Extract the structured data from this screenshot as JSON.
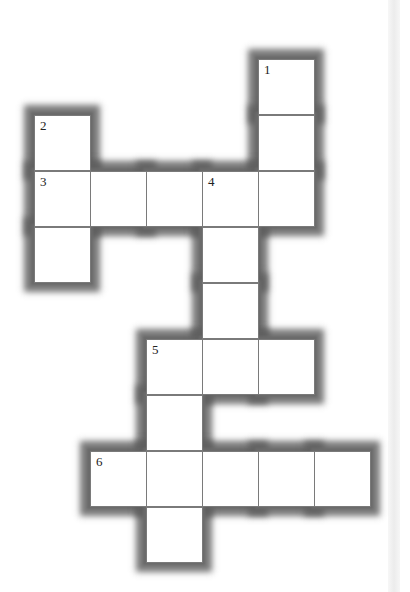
{
  "puzzle": {
    "type": "crossword",
    "cell_size_px": 56,
    "origin": {
      "x": 34,
      "y": 59
    },
    "cells": [
      {
        "row": 0,
        "col": 4,
        "number": "1"
      },
      {
        "row": 1,
        "col": 0,
        "number": "2"
      },
      {
        "row": 1,
        "col": 4,
        "number": ""
      },
      {
        "row": 2,
        "col": 0,
        "number": "3"
      },
      {
        "row": 2,
        "col": 1,
        "number": ""
      },
      {
        "row": 2,
        "col": 2,
        "number": ""
      },
      {
        "row": 2,
        "col": 3,
        "number": "4"
      },
      {
        "row": 2,
        "col": 4,
        "number": ""
      },
      {
        "row": 3,
        "col": 0,
        "number": ""
      },
      {
        "row": 3,
        "col": 3,
        "number": ""
      },
      {
        "row": 4,
        "col": 3,
        "number": ""
      },
      {
        "row": 5,
        "col": 2,
        "number": "5"
      },
      {
        "row": 5,
        "col": 3,
        "number": ""
      },
      {
        "row": 5,
        "col": 4,
        "number": ""
      },
      {
        "row": 6,
        "col": 2,
        "number": ""
      },
      {
        "row": 7,
        "col": 1,
        "number": "6"
      },
      {
        "row": 7,
        "col": 2,
        "number": ""
      },
      {
        "row": 7,
        "col": 3,
        "number": ""
      },
      {
        "row": 7,
        "col": 4,
        "number": ""
      },
      {
        "row": 7,
        "col": 5,
        "number": ""
      },
      {
        "row": 8,
        "col": 2,
        "number": ""
      }
    ],
    "clue_numbers": [
      "1",
      "2",
      "3",
      "4",
      "5",
      "6"
    ],
    "colors": {
      "cell_fill": "#ffffff",
      "grid_line": "#7a7a7a",
      "border_shadow": "#6a6a6a",
      "number_text": "#222222"
    }
  }
}
